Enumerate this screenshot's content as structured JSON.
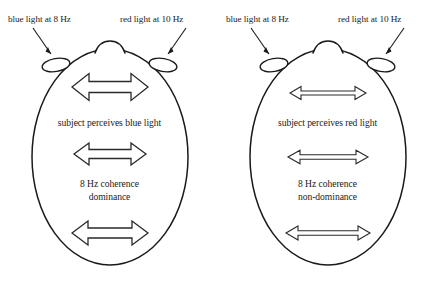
{
  "figure": {
    "background_color": "#ffffff",
    "stroke_color": "#1a1a1a"
  },
  "panels": [
    {
      "id": "left",
      "head_label": "dominance-head",
      "labels": {
        "left_stimulus": "blue light at 8 Hz",
        "right_stimulus": "red light at 10 Hz"
      },
      "percept_text": "subject perceives blue light",
      "coherence_line1": "8 Hz coherence",
      "coherence_line2": "dominance",
      "arrows": [
        {
          "name": "arrow-top",
          "style": "thick",
          "y": 87,
          "half_width": 38,
          "shaft_half_height": 5.5,
          "head_half_height": 13.5,
          "head_length": 17
        },
        {
          "name": "arrow-middle",
          "style": "thick",
          "y": 154,
          "half_width": 36,
          "shaft_half_height": 4.5,
          "head_half_height": 11.0,
          "head_length": 15
        },
        {
          "name": "arrow-bottom",
          "style": "thick",
          "y": 233,
          "half_width": 38,
          "shaft_half_height": 5.0,
          "head_half_height": 12.0,
          "head_length": 16
        }
      ]
    },
    {
      "id": "right",
      "head_label": "non-dominance-head",
      "labels": {
        "left_stimulus": "blue light at 8 Hz",
        "right_stimulus": "red light at 10 Hz"
      },
      "percept_text": "subject perceives red light",
      "coherence_line1": "8 Hz coherence",
      "coherence_line2": "non-dominance",
      "arrows": [
        {
          "name": "arrow-top",
          "style": "thin",
          "y": 93,
          "half_width": 38,
          "shaft_half_height": 2.0,
          "head_half_height": 6.5,
          "head_length": 11
        },
        {
          "name": "arrow-middle",
          "style": "thin",
          "y": 157,
          "half_width": 40,
          "shaft_half_height": 2.2,
          "head_half_height": 6.8,
          "head_length": 12
        },
        {
          "name": "arrow-bottom",
          "style": "thin",
          "y": 233,
          "half_width": 42,
          "shaft_half_height": 2.2,
          "head_half_height": 7.0,
          "head_length": 12
        }
      ]
    }
  ]
}
